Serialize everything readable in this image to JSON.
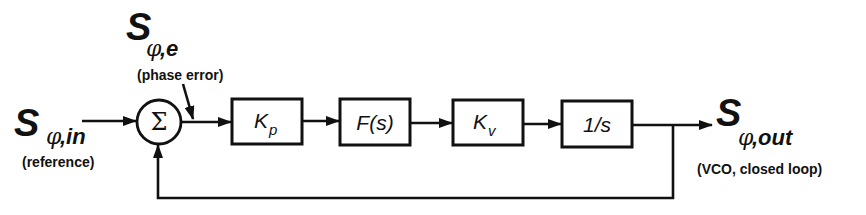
{
  "diagram": {
    "type": "block-diagram",
    "signals": {
      "input": {
        "symbol": "S",
        "subscript_phi": "φ",
        "subscript_rest": ",in",
        "note": "(reference)"
      },
      "error": {
        "symbol": "S",
        "subscript_phi": "φ",
        "subscript_rest": ",e",
        "note": "(phase error)"
      },
      "output": {
        "symbol": "S",
        "subscript_phi": "φ",
        "subscript_rest": ",out",
        "note": "(VCO, closed loop)"
      }
    },
    "summing_junction": {
      "symbol": "Σ"
    },
    "blocks": [
      {
        "id": "kp",
        "main": "K",
        "sub": "p"
      },
      {
        "id": "fs",
        "main": "F(s)",
        "sub": ""
      },
      {
        "id": "kv",
        "main": "K",
        "sub": "v"
      },
      {
        "id": "integrator",
        "main": "1/s",
        "sub": ""
      }
    ],
    "connections": [
      "input -> summing_junction",
      "summing_junction -> K_p",
      "K_p -> F(s)",
      "F(s) -> K_v",
      "K_v -> 1/s",
      "1/s -> output",
      "output -> summing_junction (feedback)"
    ]
  }
}
